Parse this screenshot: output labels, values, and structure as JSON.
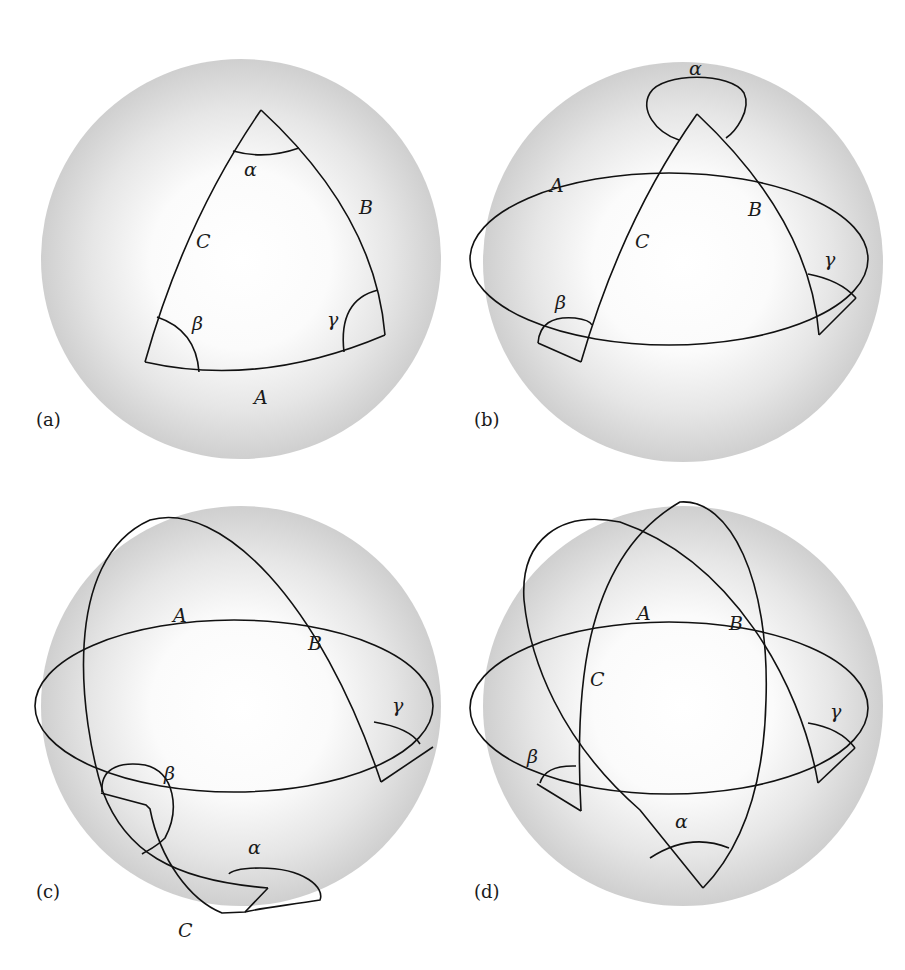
{
  "figure": {
    "panels": [
      {
        "id": "a",
        "label": "(a)",
        "sides": {
          "A": "A",
          "B": "B",
          "C": "C"
        },
        "angles": {
          "alpha": "α",
          "beta": "β",
          "gamma": "γ"
        }
      },
      {
        "id": "b",
        "label": "(b)",
        "sides": {
          "A": "A",
          "B": "B",
          "C": "C"
        },
        "angles": {
          "alpha": "α",
          "beta": "β",
          "gamma": "γ"
        }
      },
      {
        "id": "c",
        "label": "(c)",
        "sides": {
          "A": "A",
          "B": "B",
          "C": "C"
        },
        "angles": {
          "alpha": "α",
          "beta": "β",
          "gamma": "γ"
        }
      },
      {
        "id": "d",
        "label": "(d)",
        "sides": {
          "A": "A",
          "B": "B",
          "C": "C"
        },
        "angles": {
          "alpha": "α",
          "beta": "β",
          "gamma": "γ"
        }
      }
    ]
  },
  "colors": {
    "sphere_center": "#ffffff",
    "sphere_edge": "#c8c8c8",
    "line": "#111111",
    "background": "#ffffff"
  }
}
